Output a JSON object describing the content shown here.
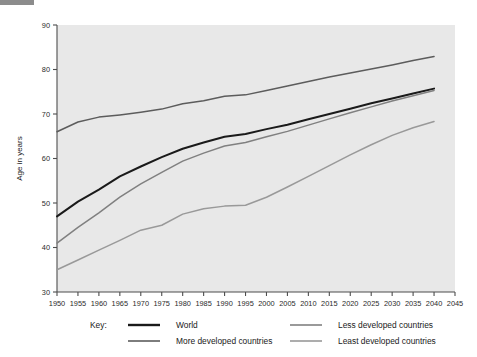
{
  "chart_data": {
    "type": "line",
    "title": "",
    "xlabel": "",
    "ylabel": "Age in years",
    "xlim": [
      1950,
      2045
    ],
    "ylim": [
      30,
      90
    ],
    "x_ticks": [
      1950,
      1955,
      1960,
      1965,
      1970,
      1975,
      1980,
      1985,
      1990,
      1995,
      2000,
      2005,
      2010,
      2015,
      2020,
      2025,
      2030,
      2035,
      2040,
      2045
    ],
    "y_ticks": [
      30,
      40,
      50,
      60,
      70,
      80,
      90
    ],
    "grid": false,
    "legend_position": "below",
    "legend_label": "Key:",
    "plot_background": "#e8e8e8",
    "x": [
      1950,
      1955,
      1960,
      1965,
      1970,
      1975,
      1980,
      1985,
      1990,
      1995,
      2000,
      2005,
      2010,
      2015,
      2020,
      2025,
      2030,
      2035,
      2040
    ],
    "series": [
      {
        "name": "World",
        "color": "#1a1a1a",
        "width": 2.0,
        "values": [
          47.0,
          50.3,
          53.0,
          56.0,
          58.2,
          60.3,
          62.2,
          63.6,
          64.9,
          65.5,
          66.6,
          67.6,
          68.8,
          70.0,
          71.2,
          72.4,
          73.5,
          74.6,
          75.7
        ]
      },
      {
        "name": "More developed countries",
        "color": "#5c5c5c",
        "width": 1.5,
        "values": [
          66.0,
          68.2,
          69.3,
          69.8,
          70.4,
          71.1,
          72.3,
          73.0,
          74.0,
          74.3,
          75.3,
          76.3,
          77.3,
          78.3,
          79.2,
          80.1,
          81.0,
          82.0,
          82.9
        ]
      },
      {
        "name": "Less developed countries",
        "color": "#808080",
        "width": 1.5,
        "values": [
          41.0,
          44.5,
          47.8,
          51.3,
          54.3,
          56.9,
          59.4,
          61.2,
          62.8,
          63.6,
          64.9,
          66.1,
          67.5,
          68.9,
          70.3,
          71.6,
          72.9,
          74.1,
          75.3
        ]
      },
      {
        "name": "Least developed countries",
        "color": "#999999",
        "width": 1.5,
        "values": [
          35.0,
          37.2,
          39.4,
          41.6,
          43.9,
          45.0,
          47.5,
          48.7,
          49.3,
          49.5,
          51.3,
          53.6,
          56.0,
          58.4,
          60.8,
          63.1,
          65.2,
          66.9,
          68.3
        ]
      }
    ]
  },
  "legend": {
    "key_label": "Key:",
    "entries": [
      {
        "label": "World",
        "color": "#1a1a1a",
        "width": 2.4
      },
      {
        "label": "More developed countries",
        "color": "#5c5c5c",
        "width": 1.6
      },
      {
        "label": "Less developed countries",
        "color": "#808080",
        "width": 1.6
      },
      {
        "label": "Least developed countries",
        "color": "#999999",
        "width": 1.6
      }
    ]
  }
}
